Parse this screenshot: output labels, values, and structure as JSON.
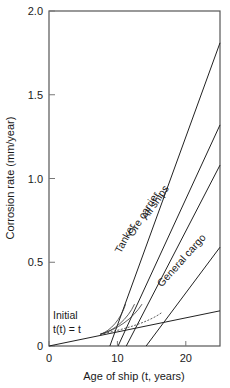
{
  "chart_data": {
    "type": "line",
    "title": "",
    "xlabel": "Age of ship (t, years)",
    "ylabel": "Corrosion rate (mm/year)",
    "xlim": [
      0,
      25
    ],
    "ylim": [
      0,
      2.0
    ],
    "xticks": [
      0,
      10,
      20
    ],
    "xtick_labels": [
      "0",
      "10",
      "20"
    ],
    "yticks": [
      0,
      0.5,
      1.0,
      1.5,
      2.0
    ],
    "ytick_labels": [
      "0",
      "0.5",
      "1.0",
      "1.5",
      "2.0"
    ],
    "grid": false,
    "legend": "inline labels",
    "series": [
      {
        "name": "Initial t(t) = t",
        "x": [
          0,
          25
        ],
        "y": [
          0,
          0.21
        ]
      },
      {
        "name": "Tanker",
        "x": [
          8.9,
          25
        ],
        "y": [
          0,
          1.81
        ]
      },
      {
        "name": "Ore carrier",
        "x": [
          10.1,
          25
        ],
        "y": [
          0,
          1.32
        ]
      },
      {
        "name": "All ships",
        "x": [
          11.3,
          25
        ],
        "y": [
          0,
          1.08
        ]
      },
      {
        "name": "General cargo",
        "x": [
          14.2,
          25
        ],
        "y": [
          0,
          0.59
        ]
      }
    ],
    "transition_curves": [
      {
        "name": "Tanker transition",
        "x": [
          7.5,
          9.0,
          10.5,
          11.2
        ],
        "y": [
          0.07,
          0.09,
          0.16,
          0.25
        ]
      },
      {
        "name": "Ore carrier transition",
        "x": [
          7.5,
          9.5,
          11.5,
          12.5
        ],
        "y": [
          0.07,
          0.09,
          0.16,
          0.25
        ]
      },
      {
        "name": "All ships transition",
        "x": [
          7.5,
          10.0,
          12.2,
          13.6
        ],
        "y": [
          0.07,
          0.1,
          0.16,
          0.25
        ]
      },
      {
        "name": "General cargo transition",
        "x": [
          7.5,
          11.0,
          14.5,
          16.5
        ],
        "y": [
          0.07,
          0.1,
          0.14,
          0.2
        ]
      }
    ],
    "annotations": [
      {
        "text": "Initial",
        "x": 0.6,
        "y": 0.16
      },
      {
        "text": "t(t) = t",
        "x": 0.6,
        "y": 0.08
      },
      {
        "text": "Tanker",
        "x": 10.5,
        "y": 0.55,
        "rotation": -62
      },
      {
        "text": "Ore carrier",
        "x": 12.3,
        "y": 0.65,
        "rotation": -58
      },
      {
        "text": "All ships",
        "x": 14.3,
        "y": 0.75,
        "rotation": -55
      },
      {
        "text": "General cargo",
        "x": 16.5,
        "y": 0.35,
        "rotation": -48
      }
    ]
  }
}
